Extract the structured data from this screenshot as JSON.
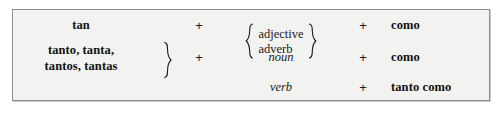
{
  "figure": {
    "name": "spanish-comparison-of-equality-table",
    "background_color": "#f2f2f0",
    "border_color": "#8e8e8e",
    "text_color": "#111111",
    "plus_symbol": "+"
  },
  "rows": [
    {
      "left": "tan",
      "left_style": "bold",
      "plus1": "+",
      "middle_options": [
        "adjective",
        "adverb"
      ],
      "middle_braced": true,
      "plus2": "+",
      "right": "como"
    },
    {
      "left_lines": [
        "tanto, tanta,",
        "tantos, tantas"
      ],
      "left_style": "bold",
      "left_braced": true,
      "plus1": "+",
      "middle": "noun",
      "middle_style": "italic",
      "plus2": "+",
      "right": "como"
    },
    {
      "left": "",
      "plus1": "",
      "middle": "verb",
      "middle_style": "italic",
      "plus2": "+",
      "right": "tanto como"
    }
  ]
}
